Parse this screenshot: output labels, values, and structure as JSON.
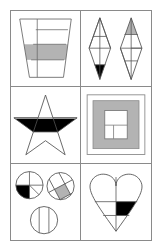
{
  "figure": {
    "title": "Geometric shapes grid with shaded fractions",
    "canvas": {
      "width": 161,
      "height": 250
    },
    "frame": {
      "x": 10,
      "y": 10,
      "width": 142,
      "height": 231,
      "border_color": "#8a8a8a"
    },
    "grid": {
      "columns": 2,
      "rows": 3,
      "divider_color": "#8a8a8a"
    },
    "palette": {
      "outline": "#5a5a5a",
      "outline_dark": "#444444",
      "fill_black": "#000000",
      "fill_gray": "#b3b3b3",
      "fill_white": "#ffffff",
      "background": "#ffffff"
    },
    "cells": [
      {
        "id": "cell-1",
        "position": "top-left",
        "shape": "trapezoid",
        "label": "Trapezoid divided into parts with one gray band shaded",
        "shaded_color": "#b3b3b3",
        "shaded_parts": 1,
        "internal_lines": [
          "vertical-left-of-center",
          "horizontal-upper",
          "horizontal-mid",
          "horizontal-lower"
        ]
      },
      {
        "id": "cell-2",
        "position": "top-right",
        "shape": "two-rhombuses",
        "label": "Two diamonds: left has black bottom tip, right has gray upper band",
        "shapes": [
          {
            "name": "rhombus-left",
            "shaded_color": "#000000",
            "shaded_region": "bottom-tip"
          },
          {
            "name": "rhombus-right",
            "shaded_color": "#b3b3b3",
            "shaded_region": "upper-band"
          }
        ]
      },
      {
        "id": "cell-3",
        "position": "middle-left",
        "shape": "five-pointed-star",
        "label": "Five-pointed star with black horizontal band across center",
        "shaded_color": "#000000",
        "shaded_region": "center-band"
      },
      {
        "id": "cell-4",
        "position": "middle-right",
        "shape": "nested-squares",
        "label": "Square frame with gray ring and white inner rectangle split into three parts",
        "shaded_color": "#b3b3b3",
        "inner_divisions": [
          "horizontal-mid",
          "vertical-lower-half"
        ]
      },
      {
        "id": "cell-5",
        "position": "bottom-left",
        "shape": "three-circles",
        "label": "Three circles: quartered with black quarter, rotated grid with gray square, and vertical thirds",
        "shapes": [
          {
            "name": "circle-quartered",
            "shaded_color": "#000000",
            "shaded_region": "bottom-left-quarter"
          },
          {
            "name": "circle-rotated-grid",
            "shaded_color": "#b3b3b3",
            "shaded_region": "center-square"
          },
          {
            "name": "circle-vertical-thirds",
            "shaded_color": "#ffffff",
            "shaded_region": "none"
          }
        ]
      },
      {
        "id": "cell-6",
        "position": "bottom-right",
        "shape": "heart",
        "label": "Heart divided by vertical and horizontal lines with black lower-right region",
        "shaded_color": "#000000",
        "shaded_region": "lower-right"
      }
    ]
  }
}
